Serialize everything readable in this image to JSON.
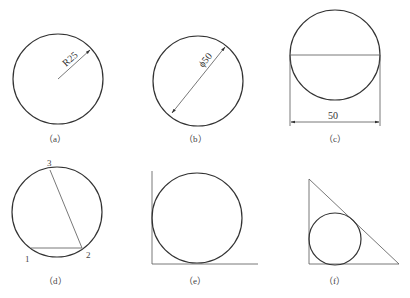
{
  "panels": [
    {
      "id": "a",
      "caption": "（a）",
      "annotation": "R25",
      "type": "radius-dimension"
    },
    {
      "id": "b",
      "caption": "（b）",
      "annotation": "ϕ50",
      "type": "diameter-dimension"
    },
    {
      "id": "c",
      "caption": "（c）",
      "annotation": "50",
      "type": "linear-dimension"
    },
    {
      "id": "d",
      "caption": "（d）",
      "points": [
        "1",
        "2",
        "3"
      ],
      "type": "three-point-circle"
    },
    {
      "id": "e",
      "caption": "（e）",
      "type": "tangent-to-two-lines"
    },
    {
      "id": "f",
      "caption": "（f）",
      "type": "inscribed-in-triangle"
    }
  ],
  "colors": {
    "stroke": "#333333",
    "background": "#ffffff"
  }
}
